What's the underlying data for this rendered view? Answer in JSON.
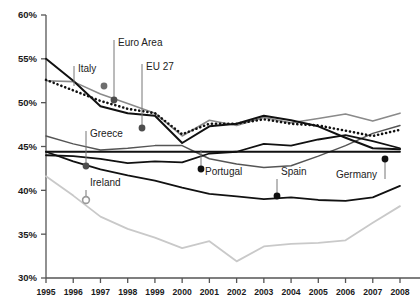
{
  "chart_data": {
    "type": "line",
    "title": "",
    "subtitle": "",
    "xlabel": "",
    "ylabel": "",
    "x": [
      1995,
      1996,
      1997,
      1998,
      1999,
      2000,
      2001,
      2002,
      2003,
      2004,
      2005,
      2006,
      2007,
      2008
    ],
    "xlim": [
      1995,
      2008
    ],
    "ylim": [
      30,
      60
    ],
    "ytick_labels": [
      "60%",
      "55%",
      "50%",
      "45%",
      "40%",
      "35%",
      "30%"
    ],
    "ytick_values": [
      60,
      55,
      50,
      45,
      40,
      35,
      30
    ],
    "xtick_labels": [
      "1995",
      "1996",
      "1997",
      "1998",
      "1999",
      "2000",
      "2001",
      "2002",
      "2003",
      "2004",
      "2005",
      "2006",
      "2007",
      "2008"
    ],
    "grid": false,
    "legend": "inline-annotations",
    "series": [
      {
        "name": "Italy",
        "style": "solid",
        "color": "#8a8a8a",
        "width": 1.6,
        "values": [
          52.5,
          52.4,
          51.0,
          49.9,
          48.8,
          46.2,
          48.0,
          47.4,
          48.3,
          47.7,
          48.2,
          48.7,
          47.9,
          48.8
        ],
        "annotation": {
          "label": "Italy",
          "marker": "filled-circle",
          "marker_color": "#6e6e6e",
          "at_x": 1996.6,
          "at_y": 51.6
        }
      },
      {
        "name": "Euro Area",
        "style": "dotted",
        "color": "#111111",
        "width": 2.6,
        "values": [
          52.6,
          51.4,
          50.2,
          49.3,
          48.8,
          46.4,
          47.6,
          47.6,
          48.1,
          47.6,
          47.4,
          46.8,
          46.2,
          46.9
        ],
        "annotation": {
          "label": "Euro Area",
          "marker": "filled-circle",
          "marker_color": "#4d4d4d",
          "at_x": 1997.4,
          "at_y": 49.7
        }
      },
      {
        "name": "EU 27",
        "style": "solid",
        "color": "#111111",
        "width": 2.0,
        "values": [
          55.0,
          52.5,
          49.6,
          48.8,
          48.5,
          45.4,
          47.3,
          47.6,
          48.5,
          48.0,
          47.3,
          46.0,
          44.8,
          44.7
        ],
        "annotation": {
          "label": "EU 27",
          "marker": "filled-circle",
          "marker_color": "#4d4d4d",
          "at_x": 1998.5,
          "at_y": 48.7
        }
      },
      {
        "name": "Greece",
        "style": "solid",
        "color": "#555555",
        "width": 1.5,
        "values": [
          46.2,
          45.3,
          44.6,
          44.8,
          45.1,
          45.1,
          43.6,
          43.0,
          42.6,
          42.8,
          43.9,
          45.1,
          46.5,
          47.4
        ],
        "annotation": {
          "label": "Greece",
          "marker": "filled-circle",
          "marker_color": "#4d4d4d",
          "at_x": 1997.0,
          "at_y": 44.8
        }
      },
      {
        "name": "Portugal",
        "style": "solid",
        "color": "#111111",
        "width": 1.8,
        "values": [
          44.0,
          43.9,
          43.6,
          43.1,
          43.3,
          43.2,
          44.2,
          44.4,
          45.3,
          45.1,
          45.8,
          46.3,
          45.6,
          44.8
        ],
        "annotation": {
          "label": "Portugal",
          "marker": "filled-circle",
          "marker_color": "#111111",
          "at_x": 2000.6,
          "at_y": 44.4
        }
      },
      {
        "name": "Spain",
        "style": "solid",
        "color": "#111111",
        "width": 1.8,
        "values": [
          44.4,
          43.3,
          42.4,
          41.7,
          41.1,
          40.3,
          39.6,
          39.3,
          39.0,
          39.2,
          38.9,
          38.8,
          39.2,
          40.5
        ],
        "annotation": {
          "label": "Spain",
          "marker": "filled-circle",
          "marker_color": "#111111",
          "at_x": 2003.6,
          "at_y": 39.0
        }
      },
      {
        "name": "Germany",
        "style": "solid",
        "color": "#111111",
        "width": 1.8,
        "values": [
          44.4,
          44.4,
          44.4,
          44.4,
          44.4,
          44.4,
          44.4,
          44.4,
          44.4,
          44.4,
          44.4,
          44.4,
          44.4,
          44.4
        ],
        "annotation": {
          "label": "Germany",
          "marker": "filled-circle",
          "marker_color": "#111111",
          "at_x": 2007.2,
          "at_y": 44.4
        }
      },
      {
        "name": "Ireland",
        "style": "solid",
        "color": "#c9c9c9",
        "width": 1.8,
        "values": [
          41.6,
          39.4,
          37.0,
          35.6,
          34.6,
          33.4,
          34.2,
          31.9,
          33.6,
          33.9,
          34.0,
          34.3,
          36.3,
          38.2
        ],
        "annotation": {
          "label": "Ireland",
          "marker": "open-circle",
          "marker_color": "#9a9a9a",
          "at_x": 1996.6,
          "at_y": 38.3
        }
      }
    ],
    "annotations": [
      {
        "label": "Italy"
      },
      {
        "label": "Euro Area"
      },
      {
        "label": "EU 27"
      },
      {
        "label": "Greece"
      },
      {
        "label": "Portugal"
      },
      {
        "label": "Spain"
      },
      {
        "label": "Germany"
      },
      {
        "label": "Ireland"
      }
    ]
  }
}
